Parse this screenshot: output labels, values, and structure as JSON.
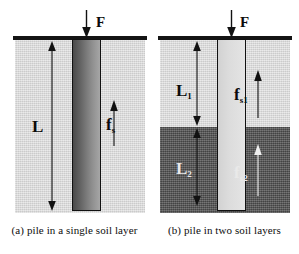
{
  "figure": {
    "background": "#ffffff",
    "panels": [
      {
        "id": "panel-a",
        "caption": "(a) pile in a single soil layer",
        "force_label": "F",
        "length_label": "L",
        "friction_label": "f",
        "friction_sub": "s",
        "soil_layers": [
          {
            "name": "single soil layer",
            "color": "#d9d9d9",
            "tone": "light"
          }
        ],
        "pile": {
          "fill_from": "#4a4a4a",
          "fill_to": "#a6a6a6",
          "outline": "#111111"
        }
      },
      {
        "id": "panel-b",
        "caption": "(b) pile in two soil layers",
        "force_label": "F",
        "length_labels": [
          {
            "text": "L",
            "sub": "1"
          },
          {
            "text": "L",
            "sub": "2"
          }
        ],
        "friction_labels": [
          {
            "text": "f",
            "sub": "s1"
          },
          {
            "text": "f",
            "sub": "s2"
          }
        ],
        "soil_layers": [
          {
            "name": "upper soil layer",
            "color": "#d9d9d9",
            "tone": "light"
          },
          {
            "name": "lower soil layer",
            "color": "#5c5c5c",
            "tone": "dark"
          }
        ],
        "pile": {
          "fill_from": "#d2d2d2",
          "fill_to": "#e4e4e4",
          "outline": "#111111"
        }
      }
    ],
    "colors": {
      "ground_line": "#141414",
      "arrow": "#121212",
      "arrow_light": "#efefef",
      "text": "#0b0b0b",
      "text_light": "#e9e9e9"
    }
  }
}
